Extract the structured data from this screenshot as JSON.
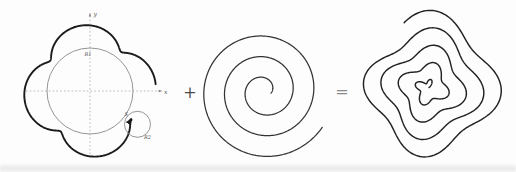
{
  "figure": {
    "operators": {
      "plus": "+",
      "equals": "="
    },
    "operator_pos": {
      "plus": {
        "x": 190,
        "y": 98
      },
      "equals": {
        "x": 342,
        "y": 97
      }
    },
    "left": {
      "axis_labels": {
        "x": "x",
        "y": "y"
      },
      "labels": {
        "big_circle": "R1",
        "small_circle": "R2",
        "point": "S"
      },
      "axes": {
        "x": {
          "x1": 26,
          "x2": 161,
          "y": 91
        },
        "y": {
          "x": 90,
          "y1": 158,
          "y2": 14
        }
      },
      "base_circle": {
        "cx": 90,
        "cy": 91,
        "r": 43
      },
      "rolling_circle": {
        "cx": 137.5,
        "cy": 124.3,
        "r": 13
      },
      "curve": {
        "cx": 90,
        "cy": 91,
        "R": 58,
        "d": 8,
        "k": 4.95,
        "c": 203.75,
        "psi0": -6,
        "psi1": -325
      },
      "label_pos": {
        "R1": {
          "x": 84.5,
          "y": 56
        },
        "R2": {
          "x": 144,
          "y": 139
        },
        "S": {
          "x": 124.5,
          "y": 115.5
        },
        "x": {
          "x": 164,
          "y": 93.5
        },
        "y": {
          "x": 93.5,
          "y": 16
        }
      }
    },
    "middle": {
      "spiral": {
        "cx": 264,
        "cy": 91,
        "b": 3.3,
        "th0": 20.8,
        "th1": 2.2,
        "alpha0": 32,
        "amp0": 0,
        "ampSlope": 0,
        "freq": 1,
        "phase": 0
      }
    },
    "right": {
      "spiral": {
        "cx": 428,
        "cy": 88,
        "b": 2.48,
        "th0": 28.2,
        "th1": 1.6,
        "alpha0": 250,
        "amp0": 2.5,
        "ampSlope": 0.09,
        "freq": 3.95,
        "phase": 0
      }
    },
    "colors": {
      "thick_curve": "#1b1b1b",
      "guide_gray": "#8f8f8f",
      "axis_gray": "#a3a3a3",
      "spiral": "#333333",
      "result_curve": "#222222",
      "plus": "#4a4a4a",
      "equals": "#8a8a8a",
      "background": "#fdfdfd"
    }
  }
}
